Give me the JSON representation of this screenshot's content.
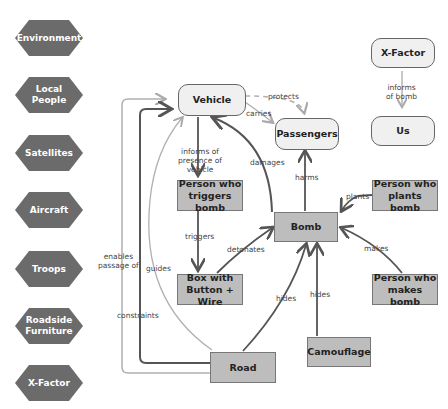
{
  "legend_factors": [
    {
      "label": "Environment"
    },
    {
      "label": "Local\nPeople"
    },
    {
      "label": "Satellites"
    },
    {
      "label": "Aircraft"
    },
    {
      "label": "Troops"
    },
    {
      "label": "Roadside\nFurniture"
    },
    {
      "label": "X-Factor"
    }
  ],
  "nodes": {
    "vehicle": "Vehicle",
    "passengers": "Passengers",
    "xfactor": "X-Factor",
    "us": "Us",
    "trigger_person": "Person who\ntriggers bomb",
    "bomb": "Bomb",
    "planter": "Person who\nplants bomb",
    "maker": "Person who\nmakes bomb",
    "box": "Box with\nButton + Wire",
    "road": "Road",
    "camouflage": "Camouflage"
  },
  "edges": {
    "protects": "protects",
    "carries": "carries",
    "informs_vehicle": "informs of\npresence of vehicle",
    "damages": "damages",
    "harms": "harms",
    "plants": "plants",
    "makes": "makes",
    "triggers": "triggers",
    "detonates": "detonates",
    "hides_road": "hides",
    "hides_camo": "hides",
    "enables": "enables\npassage of",
    "guides": "guides",
    "constraints": "constraints",
    "informs_bomb": "informs\nof bomb"
  },
  "colors": {
    "hex_fill": "#6b6b6b",
    "rect_fill": "#bdbdbd",
    "rounded_fill": "#f0f0f0",
    "dark_arrow": "#555555",
    "light_arrow": "#b0b0b0"
  }
}
